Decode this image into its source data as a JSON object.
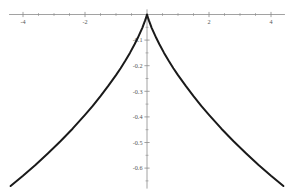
{
  "chart_data": {
    "type": "line",
    "title": "",
    "subtitle": "",
    "xlabel": "",
    "ylabel": "",
    "xlim": [
      -4.45,
      4.45
    ],
    "ylim": [
      -0.68,
      0.02
    ],
    "grid": false,
    "legend": null,
    "axis_style": "cartesian-crosshair",
    "line_color": "#1a1a1a",
    "axis_color": "#8a8a8a",
    "tick_label_color": "#555555",
    "x_ticks_major": [
      -4,
      -2,
      2,
      4
    ],
    "x_tick_labels": [
      "-4",
      "-2",
      "2",
      "4"
    ],
    "x_ticks_minor": [
      -3.5,
      -3,
      -2.5,
      -1.5,
      -1,
      -0.5,
      0.5,
      1,
      1.5,
      2.5,
      3,
      3.5
    ],
    "y_ticks_major": [
      -0.1,
      -0.2,
      -0.3,
      -0.4,
      -0.5,
      -0.6
    ],
    "y_tick_labels": [
      "-0.1",
      "-0.2",
      "-0.3",
      "-0.4",
      "-0.5",
      "-0.6"
    ],
    "y_ticks_minor": [
      -0.05,
      -0.15,
      -0.25,
      -0.35,
      -0.45,
      -0.55,
      -0.65
    ],
    "series": [
      {
        "name": "curve",
        "points": [
          [
            -4.4,
            -0.67
          ],
          [
            -4.0,
            -0.63
          ],
          [
            -3.6,
            -0.588
          ],
          [
            -3.2,
            -0.543
          ],
          [
            -2.8,
            -0.496
          ],
          [
            -2.4,
            -0.446
          ],
          [
            -2.0,
            -0.392
          ],
          [
            -1.75,
            -0.357
          ],
          [
            -1.5,
            -0.319
          ],
          [
            -1.25,
            -0.279
          ],
          [
            -1.0,
            -0.237
          ],
          [
            -0.85,
            -0.21
          ],
          [
            -0.7,
            -0.181
          ],
          [
            -0.55,
            -0.15
          ],
          [
            -0.4,
            -0.116
          ],
          [
            -0.3,
            -0.092
          ],
          [
            -0.22,
            -0.071
          ],
          [
            -0.15,
            -0.052
          ],
          [
            -0.1,
            -0.036
          ],
          [
            -0.06,
            -0.023
          ],
          [
            -0.03,
            -0.012
          ],
          [
            -0.012,
            -0.005
          ],
          [
            0,
            0
          ],
          [
            0.012,
            -0.005
          ],
          [
            0.03,
            -0.012
          ],
          [
            0.06,
            -0.023
          ],
          [
            0.1,
            -0.036
          ],
          [
            0.15,
            -0.052
          ],
          [
            0.22,
            -0.071
          ],
          [
            0.3,
            -0.092
          ],
          [
            0.4,
            -0.116
          ],
          [
            0.55,
            -0.15
          ],
          [
            0.7,
            -0.181
          ],
          [
            0.85,
            -0.21
          ],
          [
            1.0,
            -0.237
          ],
          [
            1.25,
            -0.279
          ],
          [
            1.5,
            -0.319
          ],
          [
            1.75,
            -0.357
          ],
          [
            2.0,
            -0.392
          ],
          [
            2.4,
            -0.446
          ],
          [
            2.8,
            -0.496
          ],
          [
            3.2,
            -0.543
          ],
          [
            3.6,
            -0.588
          ],
          [
            4.0,
            -0.63
          ],
          [
            4.4,
            -0.67
          ]
        ]
      }
    ]
  }
}
